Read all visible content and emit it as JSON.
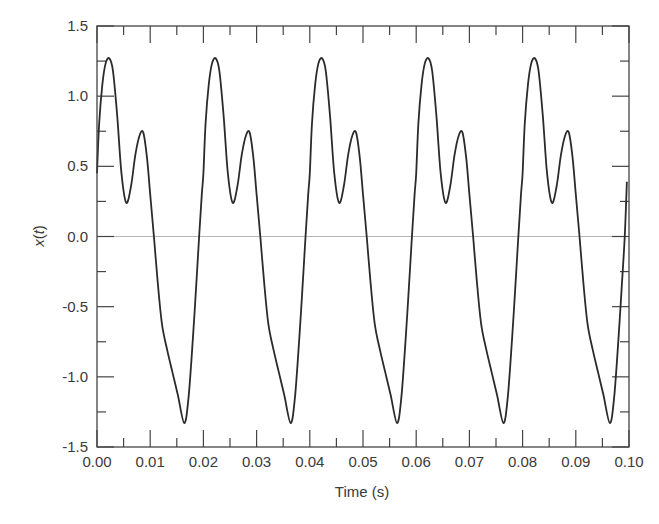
{
  "chart_data": {
    "type": "line",
    "title": "",
    "xlabel": "Time (s)",
    "ylabel": "x(t)",
    "ylabel_parts": {
      "name": "x",
      "open": "(",
      "var": "t",
      "close": ")"
    },
    "xlim": [
      0.0,
      0.1
    ],
    "ylim": [
      -1.5,
      1.5
    ],
    "xticks": [
      0.0,
      0.01,
      0.02,
      0.03,
      0.04,
      0.05,
      0.06,
      0.07,
      0.08,
      0.09,
      0.1
    ],
    "xtick_labels": [
      "0.00",
      "0.01",
      "0.02",
      "0.03",
      "0.04",
      "0.05",
      "0.06",
      "0.07",
      "0.08",
      "0.09",
      "0.10"
    ],
    "yticks": [
      -1.5,
      -1.0,
      -0.5,
      0.0,
      0.5,
      1.0,
      1.5
    ],
    "ytick_labels": [
      "-1.5",
      "-1.0",
      "-0.5",
      "0.0",
      "0.5",
      "1.0",
      "1.5"
    ],
    "minor_ticks": true,
    "grid": false,
    "zero_line": true,
    "legend": null,
    "period_s": 0.02,
    "periodic_waveform_one_period": {
      "t": [
        0.0,
        0.0004,
        0.001,
        0.0016,
        0.0023,
        0.003,
        0.0038,
        0.0046,
        0.0055,
        0.0064,
        0.0072,
        0.008,
        0.0087,
        0.0094,
        0.01,
        0.0107,
        0.0114,
        0.0122,
        0.0132,
        0.0142,
        0.0152,
        0.0164,
        0.0172,
        0.018,
        0.0186,
        0.0192,
        0.0197,
        0.02
      ],
      "x": [
        0.45,
        0.8,
        1.08,
        1.23,
        1.27,
        1.18,
        0.86,
        0.45,
        0.24,
        0.36,
        0.58,
        0.72,
        0.74,
        0.56,
        0.3,
        0.0,
        -0.32,
        -0.62,
        -0.81,
        -0.97,
        -1.13,
        -1.33,
        -1.15,
        -0.74,
        -0.38,
        0.0,
        0.3,
        0.45
      ]
    },
    "series": [
      {
        "name": "x(t)",
        "color": "#2b2b2b",
        "t_end": 0.0996,
        "end_value": 0.39,
        "extrema": {
          "global_max": 1.27,
          "global_min": -1.33,
          "local_max": 0.74,
          "local_min": 0.24
        }
      }
    ]
  },
  "colors": {
    "axis": "#444444",
    "line": "#2b2b2b",
    "zero_line": "#b8b8b8",
    "text": "#3a3a3a"
  }
}
